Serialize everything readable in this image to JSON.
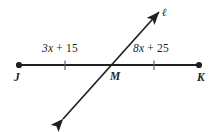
{
  "figure": {
    "background_color": "#ffffff",
    "stroke_color": "#231f20",
    "line_jk": {
      "name": "line-JK",
      "endpoints": [
        {
          "label": "J",
          "x": 19,
          "y": 65,
          "endpoint_style": "filled-dot"
        },
        {
          "label": "K",
          "x": 199,
          "y": 65,
          "endpoint_style": "filled-dot"
        }
      ],
      "intersection_point": {
        "label": "M",
        "x": 110,
        "y": 65
      },
      "tick_marks": [
        {
          "name": "tick-left",
          "x": 65,
          "y": 65
        },
        {
          "name": "tick-right",
          "x": 154,
          "y": 65
        }
      ],
      "segments": [
        {
          "name": "segment-JM",
          "label": "3x + 15",
          "coefficient": "3",
          "variable": "x",
          "operator": "+",
          "constant": "15"
        },
        {
          "name": "segment-MK",
          "label": "8x + 25",
          "coefficient": "8",
          "variable": "x",
          "operator": "+",
          "constant": "25"
        }
      ]
    },
    "transversal": {
      "name": "line-l",
      "label": "ℓ",
      "arrow_style": "double-headed",
      "from": {
        "x": 63,
        "y": 119
      },
      "to": {
        "x": 159,
        "y": 12
      }
    },
    "labels": {
      "segment_left": "3x + 15",
      "segment_left_coefficient": "3",
      "segment_left_variable": "x",
      "segment_left_tail": " + 15",
      "segment_right": "8x + 25",
      "segment_right_coefficient": "8",
      "segment_right_variable": "x",
      "segment_right_tail": " + 25",
      "point_j": "J",
      "point_m": "M",
      "point_k": "K",
      "line_name": "ℓ"
    }
  }
}
